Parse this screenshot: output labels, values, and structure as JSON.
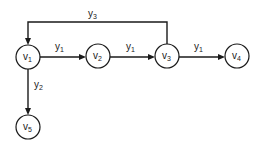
{
  "diagram": {
    "type": "signal-flow-graph",
    "colors": {
      "stroke": "#1a1a1a",
      "background": "#ffffff"
    },
    "nodes": [
      {
        "id": "v1",
        "base": "v",
        "sub": "1",
        "cx": 28,
        "cy": 57
      },
      {
        "id": "v2",
        "base": "v",
        "sub": "2",
        "cx": 98,
        "cy": 56
      },
      {
        "id": "v3",
        "base": "v",
        "sub": "3",
        "cx": 167,
        "cy": 56
      },
      {
        "id": "v4",
        "base": "v",
        "sub": "4",
        "cx": 237,
        "cy": 56
      },
      {
        "id": "v5",
        "base": "v",
        "sub": "5",
        "cx": 28,
        "cy": 127
      }
    ],
    "node_radius": 12,
    "edges": [
      {
        "from": "v1",
        "to": "v2",
        "label_base": "y",
        "label_sub": "1"
      },
      {
        "from": "v2",
        "to": "v3",
        "label_base": "y",
        "label_sub": "1"
      },
      {
        "from": "v3",
        "to": "v4",
        "label_base": "y",
        "label_sub": "1"
      },
      {
        "from": "v1",
        "to": "v5",
        "label_base": "y",
        "label_sub": "2"
      },
      {
        "from": "v3",
        "to": "v1",
        "label_base": "y",
        "label_sub": "3",
        "routing": "over-top"
      }
    ]
  }
}
